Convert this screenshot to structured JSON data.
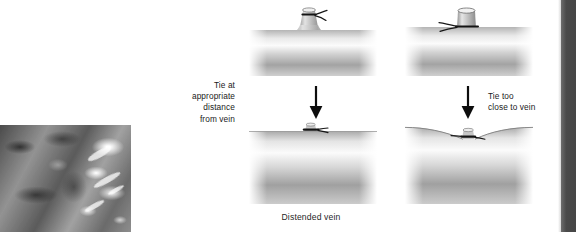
{
  "figure": {
    "caption": "Distended vein",
    "labels": {
      "left": "Tie at\nappropriate\ndistance\nfrom vein",
      "right": "Tie too\nclose to vein"
    },
    "panels": [
      {
        "id": "top-left",
        "position": "top-left",
        "description": "Distended vein with tributary branch; ligature tied at an appropriate distance from the vein wall",
        "tie_position": "away-from-vein",
        "wall_result": "smooth"
      },
      {
        "id": "top-right",
        "position": "top-right",
        "description": "Distended vein with short tributary stump; ligature tied flush at the base of the branch",
        "tie_position": "flush-at-vein",
        "wall_result": "smooth"
      },
      {
        "id": "bottom-left",
        "position": "bottom-left",
        "description": "Result of correct tie: vein wall remains straight and unconstricted",
        "tie_position": "away-from-vein",
        "wall_result": "smooth"
      },
      {
        "id": "bottom-right",
        "position": "bottom-right",
        "description": "Result of tie too close: vein wall is tented inward producing a narrowed waist",
        "tie_position": "flush-at-vein",
        "wall_result": "indented"
      }
    ],
    "arrows": [
      {
        "id": "left-arrow",
        "direction": "down"
      },
      {
        "id": "right-arrow",
        "direction": "down"
      }
    ],
    "photo": {
      "id": "intraoperative-photo",
      "description": "Grayscale intraoperative photograph of a dissected vein and surrounding tissue"
    },
    "colors": {
      "vessel_light": "#f2f2f2",
      "vessel_mid": "#b9b9b9",
      "vessel_dark": "#8a8a8a",
      "ink": "#1a1a1a",
      "gutter": "#4a4a4a"
    }
  }
}
